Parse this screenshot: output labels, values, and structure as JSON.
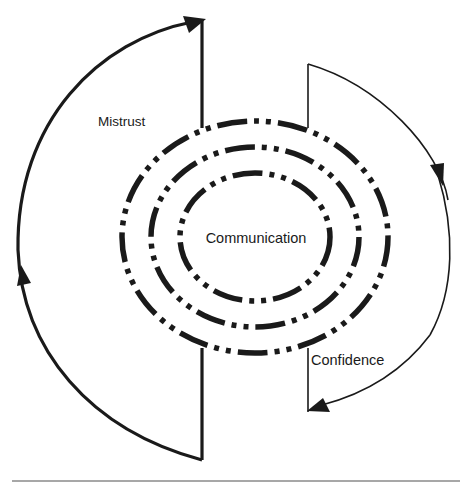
{
  "diagram": {
    "type": "cycle-diagram",
    "center_label": "Communication",
    "rings": [
      {
        "name": "outer",
        "cx": 255,
        "cy": 237,
        "rx": 133,
        "ry": 116,
        "style": "dash-dot-dot"
      },
      {
        "name": "middle",
        "cx": 255,
        "cy": 237,
        "rx": 104,
        "ry": 90,
        "style": "dash-dot-dot"
      },
      {
        "name": "inner",
        "cx": 255,
        "cy": 237,
        "rx": 75,
        "ry": 64,
        "style": "dash-dot-dot"
      }
    ],
    "arrows": [
      {
        "name": "mistrust-arrow",
        "label": "Mistrust",
        "side": "left",
        "direction": "counterclockwise-up",
        "weight": "thick"
      },
      {
        "name": "confidence-arrow",
        "label": "Confidence",
        "side": "right",
        "direction": "clockwise-down",
        "weight": "thin"
      }
    ],
    "labels": {
      "mistrust": "Mistrust",
      "confidence": "Confidence",
      "communication": "Communication"
    },
    "colors": {
      "stroke": "#1a1a1a",
      "rule": "#8a8a8a",
      "background": "#ffffff"
    }
  }
}
